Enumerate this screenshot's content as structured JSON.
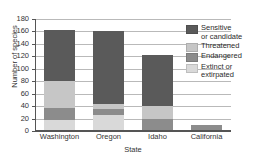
{
  "chart_data": {
    "type": "bar",
    "subtype": "stacked-vertical",
    "title": "",
    "xlabel": "State",
    "ylabel": "Number of species",
    "categories": [
      "Washington",
      "Oregon",
      "Idaho",
      "California"
    ],
    "ylim": [
      0,
      180
    ],
    "yticks": [
      0,
      20,
      40,
      60,
      80,
      100,
      120,
      140,
      160,
      180
    ],
    "grid": true,
    "legend_position": "right-inside",
    "series": [
      {
        "name": "Extinct or extirpated",
        "color": "#d9d9d9",
        "values": [
          18,
          26,
          0,
          0
        ]
      },
      {
        "name": "Endangered",
        "color": "#8c8c8c",
        "values": [
          19,
          9,
          19,
          10
        ]
      },
      {
        "name": "Threatened",
        "color": "#c6c6c6",
        "values": [
          43,
          9,
          22,
          0
        ]
      },
      {
        "name": "Sensitive or candidate",
        "color": "#5a5a5a",
        "values": [
          83,
          116,
          81,
          0
        ]
      }
    ],
    "totals": [
      163,
      160,
      122,
      10
    ]
  },
  "legend": {
    "entries": [
      {
        "label_line1": "Sensitive",
        "label_line2": "or candidate",
        "color": "#5a5a5a"
      },
      {
        "label_line1": "Threatened",
        "label_line2": "",
        "color": "#c6c6c6"
      },
      {
        "label_line1": "Endangered",
        "label_line2": "",
        "color": "#8c8c8c"
      },
      {
        "label_line1": "Extinct or",
        "label_line2": "extirpated",
        "color": "#d9d9d9"
      }
    ]
  },
  "axes": {
    "y_title": "Number of species",
    "x_title": "State",
    "y_tick_labels": [
      "0",
      "20",
      "40",
      "60",
      "80",
      "100",
      "120",
      "140",
      "160",
      "180"
    ],
    "x_tick_labels": [
      "Washington",
      "Oregon",
      "Idaho",
      "California"
    ]
  },
  "colors": {
    "gridline": "#b9b9b9",
    "axis": "#555555",
    "background": "#ffffff",
    "text": "#2b2b2b"
  }
}
